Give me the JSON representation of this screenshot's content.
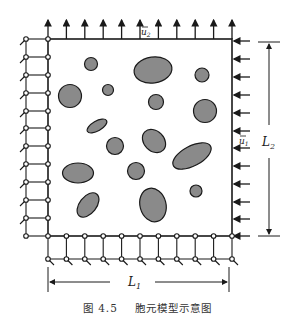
{
  "figure": {
    "caption_number": "图 4.5",
    "caption_title": "胞元模型示意图"
  },
  "labels": {
    "u2": "u",
    "u2_sub": "2",
    "u1": "u",
    "u1_sub": "1",
    "L1": "L",
    "L1_sub": "1",
    "L2": "L",
    "L2_sub": "2"
  },
  "colors": {
    "line": "#1a1a1a",
    "inclusion_fill": "#8a8a8a",
    "background": "#ffffff"
  },
  "diagram": {
    "inclusion_count": 18
  }
}
